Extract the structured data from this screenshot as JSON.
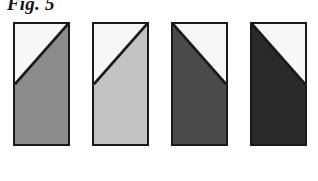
{
  "figure": {
    "label": "Fig. 5",
    "background_color": "#ffffff",
    "border_color": "#1a1a1a",
    "light_fill_color": "#f7f7f7"
  },
  "chart_data": {
    "type": "table",
    "title": "Fig. 5",
    "xlabel": "",
    "ylabel": "",
    "categories": [
      "1",
      "2",
      "3",
      "4"
    ],
    "values": [
      45,
      25,
      71,
      84
    ],
    "series": [
      {
        "name": "shaded_gray_level_percent",
        "values": [
          45,
          25,
          71,
          84
        ]
      },
      {
        "name": "shaded_area_fraction_percent",
        "values": [
          74,
          74,
          74,
          74
        ]
      }
    ],
    "swatches": [
      {
        "index": 1,
        "fill_color": "#8c8c8c",
        "gray_level_percent": 45,
        "diagonal": "top-right-to-left-edge",
        "shaded_region": "lower-right",
        "light_region": "upper-left",
        "x": 13,
        "y": 22,
        "width": 57,
        "height": 124
      },
      {
        "index": 2,
        "fill_color": "#c2c2c2",
        "gray_level_percent": 25,
        "diagonal": "top-right-to-left-edge",
        "shaded_region": "lower-right",
        "light_region": "upper-left",
        "x": 92,
        "y": 22,
        "width": 57,
        "height": 124
      },
      {
        "index": 3,
        "fill_color": "#4a4a4a",
        "gray_level_percent": 71,
        "diagonal": "top-left-to-right-edge",
        "shaded_region": "lower-left",
        "light_region": "upper-right",
        "x": 171,
        "y": 22,
        "width": 57,
        "height": 124
      },
      {
        "index": 4,
        "fill_color": "#2a2a2a",
        "gray_level_percent": 84,
        "diagonal": "top-left-to-right-edge",
        "shaded_region": "lower-left",
        "light_region": "upper-right",
        "x": 250,
        "y": 22,
        "width": 57,
        "height": 124
      }
    ],
    "grid": false,
    "legend": "none"
  }
}
